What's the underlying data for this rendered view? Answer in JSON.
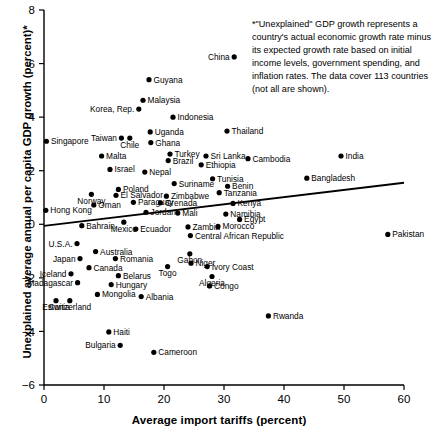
{
  "chart_data": {
    "type": "scatter",
    "title": "",
    "xlabel": "Average import tariffs (percent)",
    "ylabel": "Unexplained average annual per capita GDP growth (percent)*",
    "xlim": [
      0,
      60
    ],
    "ylim": [
      -6,
      8
    ],
    "xticks": [
      0,
      10,
      20,
      30,
      40,
      50,
      60
    ],
    "yticks": [
      -6,
      -4,
      -2,
      0,
      2,
      4,
      6,
      8
    ],
    "grid": false,
    "legend": "none",
    "annotation": "*\"Unexplained\" GDP growth represents a country's actual economic growth rate minus its expected growth rate based on initial income levels, government spending, and inflation rates. The data cover 113 countries (not all are shown).",
    "trendline": {
      "x0": 0,
      "y0": -0.06,
      "x1": 60,
      "y1": 1.55
    },
    "points": [
      {
        "label": "China",
        "x": 31.7,
        "y": 6.25,
        "side": "l"
      },
      {
        "label": "Guyana",
        "x": 17.5,
        "y": 5.4,
        "side": "r"
      },
      {
        "label": "Malaysia",
        "x": 16.5,
        "y": 4.63,
        "side": "r"
      },
      {
        "label": "Korea, Rep.",
        "x": 15.8,
        "y": 4.3,
        "side": "l"
      },
      {
        "label": "Indonesia",
        "x": 21.5,
        "y": 4.0,
        "side": "r"
      },
      {
        "label": "Uganda",
        "x": 17.7,
        "y": 3.45,
        "side": "r"
      },
      {
        "label": "Taiwan",
        "x": 12.9,
        "y": 3.22,
        "side": "l"
      },
      {
        "label": "Chile",
        "x": 14.3,
        "y": 3.22,
        "side": "c-b"
      },
      {
        "label": "Singapore",
        "x": 0.4,
        "y": 3.1,
        "side": "r"
      },
      {
        "label": "Ghana",
        "x": 17.8,
        "y": 3.05,
        "side": "r"
      },
      {
        "label": "Thailand",
        "x": 30.5,
        "y": 3.48,
        "side": "r"
      },
      {
        "label": "Turkey",
        "x": 21.0,
        "y": 2.62,
        "side": "r"
      },
      {
        "label": "Malta",
        "x": 9.6,
        "y": 2.55,
        "side": "r"
      },
      {
        "label": "Brazil",
        "x": 20.7,
        "y": 2.38,
        "side": "r"
      },
      {
        "label": "Sri Lanka",
        "x": 27.0,
        "y": 2.55,
        "side": "r"
      },
      {
        "label": "Cambodia",
        "x": 34.0,
        "y": 2.45,
        "side": "r"
      },
      {
        "label": "India",
        "x": 49.5,
        "y": 2.55,
        "side": "r"
      },
      {
        "label": "Ethiopia",
        "x": 26.2,
        "y": 2.22,
        "side": "r"
      },
      {
        "label": "Israel",
        "x": 11.0,
        "y": 2.05,
        "side": "r"
      },
      {
        "label": "Nepal",
        "x": 16.8,
        "y": 1.95,
        "side": "r"
      },
      {
        "label": "Tunisia",
        "x": 28.1,
        "y": 1.7,
        "side": "r"
      },
      {
        "label": "Bangladesh",
        "x": 43.8,
        "y": 1.72,
        "side": "r"
      },
      {
        "label": "Suriname",
        "x": 21.7,
        "y": 1.52,
        "side": "r"
      },
      {
        "label": "Benin",
        "x": 30.6,
        "y": 1.42,
        "side": "r"
      },
      {
        "label": "Poland",
        "x": 12.4,
        "y": 1.3,
        "side": "r"
      },
      {
        "label": "Norway",
        "x": 7.9,
        "y": 1.12,
        "side": "c-t"
      },
      {
        "label": "El Salvador",
        "x": 12.0,
        "y": 1.08,
        "side": "r"
      },
      {
        "label": "Zimbabwe",
        "x": 20.4,
        "y": 1.05,
        "side": "r"
      },
      {
        "label": "Tanzania",
        "x": 29.2,
        "y": 1.18,
        "side": "r"
      },
      {
        "label": "Paraguay",
        "x": 14.9,
        "y": 0.82,
        "side": "r"
      },
      {
        "label": "Grenada",
        "x": 19.4,
        "y": 0.8,
        "side": "r"
      },
      {
        "label": "Kenya",
        "x": 31.5,
        "y": 0.78,
        "side": "r"
      },
      {
        "label": "Oman",
        "x": 8.3,
        "y": 0.72,
        "side": "r"
      },
      {
        "label": "Hong Kong",
        "x": 0.3,
        "y": 0.52,
        "side": "r"
      },
      {
        "label": "Jordan",
        "x": 17.0,
        "y": 0.45,
        "side": "r"
      },
      {
        "label": "Mali",
        "x": 22.3,
        "y": 0.42,
        "side": "r"
      },
      {
        "label": "Namibia",
        "x": 30.3,
        "y": 0.38,
        "side": "r"
      },
      {
        "label": "Egypt",
        "x": 32.6,
        "y": 0.18,
        "side": "r"
      },
      {
        "label": "Mexico",
        "x": 13.3,
        "y": 0.08,
        "side": "c-t"
      },
      {
        "label": "Bahrain",
        "x": 6.3,
        "y": -0.05,
        "side": "r"
      },
      {
        "label": "Zambia",
        "x": 24.0,
        "y": -0.1,
        "side": "r"
      },
      {
        "label": "Morocco",
        "x": 29.0,
        "y": -0.08,
        "side": "r"
      },
      {
        "label": "Ecuador",
        "x": 15.3,
        "y": -0.18,
        "side": "r"
      },
      {
        "label": "Central African Republic",
        "x": 24.4,
        "y": -0.42,
        "side": "r"
      },
      {
        "label": "U.S.A.",
        "x": 5.5,
        "y": -0.72,
        "side": "l"
      },
      {
        "label": "Australia",
        "x": 8.6,
        "y": -1.02,
        "side": "r"
      },
      {
        "label": "Gabon",
        "x": 24.3,
        "y": -1.1,
        "side": "c-t"
      },
      {
        "label": "Japan",
        "x": 6.0,
        "y": -1.28,
        "side": "l"
      },
      {
        "label": "Romania",
        "x": 11.9,
        "y": -1.28,
        "side": "r"
      },
      {
        "label": "Niger",
        "x": 24.5,
        "y": -1.45,
        "side": "r"
      },
      {
        "label": "Canada",
        "x": 7.5,
        "y": -1.62,
        "side": "r"
      },
      {
        "label": "Togo",
        "x": 20.6,
        "y": -1.58,
        "side": "c-t"
      },
      {
        "label": "Ivory Coast",
        "x": 27.2,
        "y": -1.58,
        "side": "r"
      },
      {
        "label": "Iceland",
        "x": 4.5,
        "y": -1.85,
        "side": "l"
      },
      {
        "label": "Belarus",
        "x": 12.4,
        "y": -1.92,
        "side": "r"
      },
      {
        "label": "Algeria",
        "x": 28.0,
        "y": -1.95,
        "side": "c-t"
      },
      {
        "label": "Madagascar",
        "x": 5.6,
        "y": -2.18,
        "side": "l"
      },
      {
        "label": "Hungary",
        "x": 11.2,
        "y": -2.25,
        "side": "r"
      },
      {
        "label": "Congo",
        "x": 27.6,
        "y": -2.3,
        "side": "r"
      },
      {
        "label": "Estonia",
        "x": 2.0,
        "y": -2.85,
        "side": "c-b"
      },
      {
        "label": "Switzerland",
        "x": 4.3,
        "y": -2.85,
        "side": "c-b"
      },
      {
        "label": "Mongolia",
        "x": 8.9,
        "y": -2.62,
        "side": "r"
      },
      {
        "label": "Albania",
        "x": 16.2,
        "y": -2.7,
        "side": "r"
      },
      {
        "label": "Rwanda",
        "x": 37.4,
        "y": -3.42,
        "side": "r"
      },
      {
        "label": "Haiti",
        "x": 10.8,
        "y": -4.02,
        "side": "r"
      },
      {
        "label": "Bulgaria",
        "x": 12.7,
        "y": -4.52,
        "side": "l"
      },
      {
        "label": "Cameroon",
        "x": 18.3,
        "y": -4.78,
        "side": "r"
      },
      {
        "label": "Pakistan",
        "x": 57.3,
        "y": -0.38,
        "side": "r"
      }
    ]
  }
}
